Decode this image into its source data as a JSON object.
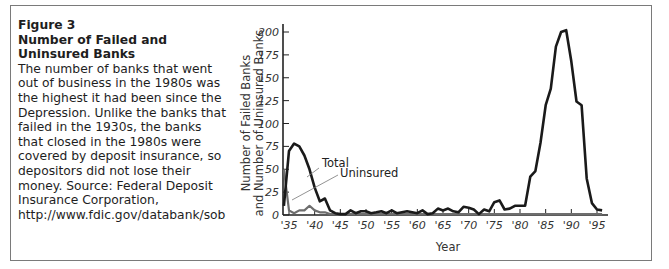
{
  "caption": {
    "figure_label": "Figure 3",
    "title": "Number of Failed and Uninsured Banks",
    "body": "The number of banks that went out of business in the 1980s was the highest it had been since the Depression. Unlike the banks that failed in the 1930s, the banks that closed in the 1980s were covered by deposit insurance, so depositors did not lose their money. Source: Federal Deposit Insurance Corporation, http://www.fdic.gov/databank/sob"
  },
  "colors": {
    "total": "#1a1a1a",
    "uninsured": "#6e6e6e",
    "frame": "#7a7a7a"
  },
  "chart_data": {
    "type": "line",
    "title": "Number of Failed and Uninsured Banks",
    "xlabel": "Year",
    "ylabel": "Number of Failed Banks and Number of Uninsured Banks",
    "ylim": [
      0,
      210
    ],
    "xlim": [
      1934,
      1996
    ],
    "grid": false,
    "legend": "inline annotations",
    "x_ticks": [
      1935,
      1940,
      1945,
      1950,
      1955,
      1960,
      1965,
      1970,
      1975,
      1980,
      1985,
      1990,
      1995
    ],
    "x_tick_labels": [
      "'35",
      "'40",
      "'45",
      "'50",
      "'55",
      "'60",
      "'65",
      "'70",
      "'75",
      "'80",
      "'85",
      "'90",
      "'95"
    ],
    "y_ticks": [
      0,
      25,
      50,
      75,
      100,
      125,
      150,
      175,
      200
    ],
    "y_tick_labels": [
      "0",
      "25",
      "50",
      "75",
      "100",
      "125",
      "150",
      "175",
      "200"
    ],
    "x": [
      1934,
      1935,
      1936,
      1937,
      1938,
      1939,
      1940,
      1941,
      1942,
      1943,
      1944,
      1945,
      1946,
      1947,
      1948,
      1949,
      1950,
      1951,
      1952,
      1953,
      1954,
      1955,
      1956,
      1957,
      1958,
      1959,
      1960,
      1961,
      1962,
      1963,
      1964,
      1965,
      1966,
      1967,
      1968,
      1969,
      1970,
      1971,
      1972,
      1973,
      1974,
      1975,
      1976,
      1977,
      1978,
      1979,
      1980,
      1981,
      1982,
      1983,
      1984,
      1985,
      1986,
      1987,
      1988,
      1989,
      1990,
      1991,
      1992,
      1993,
      1994,
      1995,
      1996
    ],
    "series": [
      {
        "name": "Total",
        "values": [
          10,
          70,
          78,
          75,
          65,
          50,
          30,
          15,
          18,
          5,
          2,
          1,
          1,
          5,
          2,
          4,
          4,
          2,
          3,
          4,
          2,
          5,
          2,
          3,
          4,
          3,
          2,
          5,
          1,
          2,
          7,
          5,
          7,
          4,
          3,
          9,
          8,
          6,
          1,
          6,
          4,
          14,
          16,
          6,
          7,
          10,
          10,
          10,
          42,
          48,
          79,
          120,
          138,
          184,
          200,
          202,
          168,
          124,
          120,
          40,
          13,
          6,
          5
        ]
      },
      {
        "name": "Uninsured",
        "values": [
          50,
          5,
          2,
          5,
          5,
          10,
          5,
          3,
          3,
          1,
          1,
          1,
          1,
          1,
          1,
          1,
          1,
          1,
          1,
          1,
          1,
          1,
          1,
          1,
          1,
          1,
          1,
          1,
          1,
          1,
          1,
          1,
          1,
          1,
          1,
          1,
          1,
          1,
          1,
          1,
          1,
          1,
          1,
          1,
          1,
          1,
          1,
          1,
          1,
          1,
          1,
          1,
          1,
          1,
          1,
          1,
          1,
          1,
          1,
          1,
          1,
          1,
          1
        ]
      }
    ],
    "annotations": [
      {
        "text": "Total",
        "points_to": "Total series near 1939"
      },
      {
        "text": "Uninsured",
        "points_to": "Uninsured series near 1935"
      }
    ]
  }
}
